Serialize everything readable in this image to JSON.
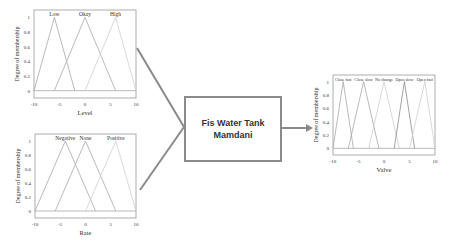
{
  "center_block": {
    "line1": "Fis Water Tank",
    "line2": "Mamdani"
  },
  "colors": {
    "connector": "#8a8a8a",
    "axis": "#9a9a9a",
    "mf_dark": "#8c8c8c",
    "mf_mid": "#a8a8a8",
    "mf_light": "#cfcfcf",
    "text": "#333333"
  },
  "chart_data": [
    {
      "type": "line",
      "title": "",
      "xlabel": "Level",
      "ylabel": "Degree of membership",
      "xlim": [
        -10,
        10
      ],
      "ylim": [
        -0.1,
        1.1
      ],
      "xticks": [
        "-10",
        "-5",
        "0",
        "5",
        "10"
      ],
      "yticks": [
        "0",
        "0.2",
        "0.4",
        "0.6",
        "0.8",
        "1"
      ],
      "grid": false,
      "series": [
        {
          "name": "Low",
          "x": [
            -10,
            -6,
            -2
          ],
          "y": [
            0,
            1,
            0
          ]
        },
        {
          "name": "Okay",
          "x": [
            -6,
            0,
            6
          ],
          "y": [
            0,
            1,
            0
          ]
        },
        {
          "name": "High",
          "x": [
            0,
            6,
            10
          ],
          "y": [
            0,
            1,
            0
          ]
        }
      ]
    },
    {
      "type": "line",
      "title": "",
      "xlabel": "Rate",
      "ylabel": "Degree of membership",
      "xlim": [
        -10,
        10
      ],
      "ylim": [
        -0.1,
        1.1
      ],
      "xticks": [
        "-10",
        "-5",
        "0",
        "5",
        "10"
      ],
      "yticks": [
        "0",
        "0.2",
        "0.4",
        "0.6",
        "0.8",
        "1"
      ],
      "grid": false,
      "series": [
        {
          "name": "Negative",
          "x": [
            -10,
            -4,
            2
          ],
          "y": [
            0,
            1,
            0
          ]
        },
        {
          "name": "None",
          "x": [
            -6,
            0,
            6
          ],
          "y": [
            0,
            1,
            0
          ]
        },
        {
          "name": "Positive",
          "x": [
            0,
            6,
            10
          ],
          "y": [
            0,
            1,
            0
          ]
        }
      ]
    },
    {
      "type": "line",
      "title": "",
      "xlabel": "Valve",
      "ylabel": "Degree of membership",
      "xlim": [
        -10,
        10
      ],
      "ylim": [
        -0.1,
        1.1
      ],
      "xticks": [
        "-10",
        "-5",
        "0",
        "5",
        "10"
      ],
      "yticks": [
        "0",
        "0.2",
        "0.4",
        "0.6",
        "0.8",
        "1"
      ],
      "grid": false,
      "series": [
        {
          "name": "Close fast",
          "x": [
            -10,
            -8,
            -6
          ],
          "y": [
            0,
            1,
            0
          ]
        },
        {
          "name": "Close slow",
          "x": [
            -7,
            -4,
            -1
          ],
          "y": [
            0,
            1,
            0
          ]
        },
        {
          "name": "No change",
          "x": [
            -3,
            0,
            3
          ],
          "y": [
            0,
            1,
            0
          ]
        },
        {
          "name": "Open slow",
          "x": [
            2,
            4,
            6
          ],
          "y": [
            0,
            1,
            0
          ]
        },
        {
          "name": "Open fast",
          "x": [
            5,
            8,
            10
          ],
          "y": [
            0,
            1,
            0
          ]
        }
      ]
    }
  ]
}
